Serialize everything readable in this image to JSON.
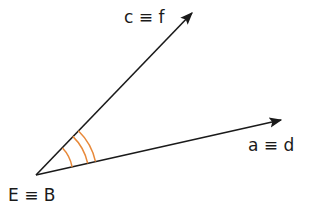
{
  "diagram": {
    "type": "angle",
    "vertex": {
      "label": "E ≡ B",
      "x": 36,
      "y": 175
    },
    "rays": [
      {
        "id": "upper",
        "label": "c ≡ f",
        "end": {
          "x": 192,
          "y": 12
        }
      },
      {
        "id": "lower",
        "label": "a ≡ d",
        "end": {
          "x": 281,
          "y": 120
        }
      }
    ],
    "angle_marks": {
      "count": 3,
      "color": "#e8893a"
    },
    "line_color": "#1a1a1a"
  },
  "labels": {
    "upper_ray": "c ≡ f",
    "lower_ray": "a ≡ d",
    "vertex": "E ≡ B"
  }
}
